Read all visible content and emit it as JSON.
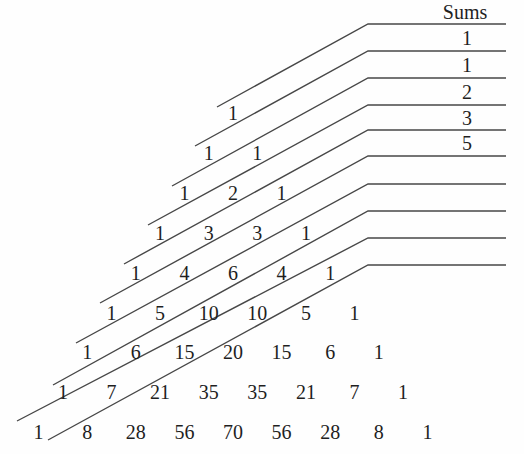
{
  "sums": {
    "label": "Sums",
    "values": [
      1,
      1,
      2,
      3,
      5
    ]
  },
  "triangle": {
    "rows": [
      [
        1
      ],
      [
        1,
        1
      ],
      [
        1,
        2,
        1
      ],
      [
        1,
        3,
        3,
        1
      ],
      [
        1,
        4,
        6,
        4,
        1
      ],
      [
        1,
        5,
        10,
        10,
        5,
        1
      ],
      [
        1,
        6,
        15,
        20,
        15,
        6,
        1
      ],
      [
        1,
        7,
        21,
        35,
        35,
        21,
        7,
        1
      ],
      [
        1,
        8,
        28,
        56,
        70,
        56,
        28,
        8,
        1
      ]
    ]
  },
  "lines": {
    "count": 10
  },
  "colors": {
    "background": "#fefefe",
    "text": "#1f1f1f",
    "line": "#474747"
  }
}
